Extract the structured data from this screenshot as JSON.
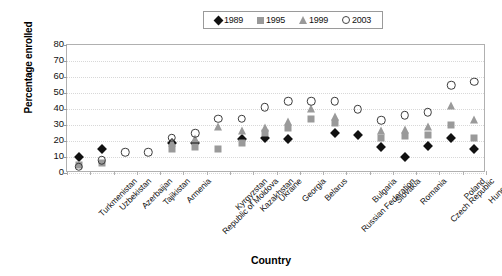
{
  "chart_data": {
    "type": "scatter",
    "title": "",
    "xlabel": "Country",
    "ylabel": "Percentage enrolled",
    "ylim": [
      0,
      80
    ],
    "ytick_step": 10,
    "yticks": [
      0,
      10,
      20,
      30,
      40,
      50,
      60,
      70,
      80
    ],
    "grid": true,
    "legend_position": "top-center",
    "categories": [
      "Turkmenistan",
      "Uzbekistan",
      "Azerbaijan",
      "Tajikistan",
      "Armenia",
      "Republic of Moldova",
      "Kyrgyzstan",
      "Kazakhstan",
      "Ukraine",
      "Georgia",
      "Belarus",
      "Russian Federation",
      "Bulgaria",
      "Slovakia",
      "Romania",
      "Czech Republic",
      "Poland",
      "Hungary"
    ],
    "series": [
      {
        "name": "1989",
        "marker": "diamond",
        "color": "#111111",
        "values": [
          10,
          15,
          null,
          null,
          19,
          19,
          null,
          21,
          22,
          21,
          null,
          25,
          24,
          16,
          10,
          17,
          22,
          15
        ]
      },
      {
        "name": "1995",
        "marker": "square",
        "color": "#9a9a9a",
        "values": [
          5,
          6,
          null,
          null,
          15,
          16,
          15,
          19,
          25,
          28,
          34,
          31,
          null,
          22,
          23,
          24,
          30,
          22
        ]
      },
      {
        "name": "1999",
        "marker": "triangle",
        "color": "#9a9a9a",
        "values": [
          null,
          null,
          null,
          null,
          19,
          21,
          29,
          26,
          28,
          32,
          40,
          35,
          null,
          26,
          27,
          29,
          42,
          33
        ]
      },
      {
        "name": "2003",
        "marker": "circle",
        "color": "#3a3a3a",
        "values": [
          4,
          8,
          13,
          13,
          22,
          25,
          34,
          34,
          41,
          45,
          45,
          45,
          40,
          33,
          36,
          38,
          55,
          57
        ]
      }
    ]
  },
  "legend": {
    "items": [
      {
        "label": "1989",
        "marker": "diamond-marker-icon"
      },
      {
        "label": "1995",
        "marker": "square-marker-icon"
      },
      {
        "label": "1999",
        "marker": "triangle-marker-icon"
      },
      {
        "label": "2003",
        "marker": "circle-marker-icon"
      }
    ]
  }
}
